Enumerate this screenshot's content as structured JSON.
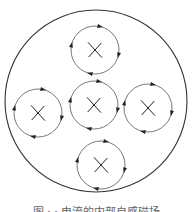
{
  "diagram": {
    "outer_circle": {
      "cx": 96,
      "cy": 101,
      "r": 91,
      "stroke": "#333333"
    },
    "field_stroke": "#555555",
    "mark": "×",
    "filaments": [
      {
        "id": "top",
        "cx": 95,
        "cy": 50,
        "r": 24,
        "direction": "clockwise"
      },
      {
        "id": "center",
        "cx": 94,
        "cy": 105,
        "r": 24,
        "direction": "clockwise"
      },
      {
        "id": "left",
        "cx": 38,
        "cy": 113,
        "r": 24,
        "direction": "clockwise"
      },
      {
        "id": "right",
        "cx": 148,
        "cy": 108,
        "r": 24,
        "direction": "clockwise"
      },
      {
        "id": "bottom",
        "cx": 101,
        "cy": 165,
        "r": 24,
        "direction": "clockwise"
      }
    ]
  },
  "caption": "图 ·  · 电流的内部自感磁场"
}
